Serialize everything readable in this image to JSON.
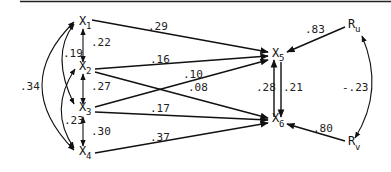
{
  "diagram": {
    "type": "path-diagram",
    "nodes": [
      {
        "id": "X1",
        "base": "X",
        "sub": "1"
      },
      {
        "id": "X2",
        "base": "X",
        "sub": "2"
      },
      {
        "id": "X3",
        "base": "X",
        "sub": "3"
      },
      {
        "id": "X4",
        "base": "X",
        "sub": "4"
      },
      {
        "id": "X5",
        "base": "X",
        "sub": "5"
      },
      {
        "id": "X6",
        "base": "X",
        "sub": "6"
      },
      {
        "id": "Ru",
        "base": "R",
        "sub": "u"
      },
      {
        "id": "Rv",
        "base": "R",
        "sub": "v"
      }
    ],
    "paths": [
      {
        "from": "X1",
        "to": "X5",
        "coef": ".29"
      },
      {
        "from": "X2",
        "to": "X5",
        "coef": ".16"
      },
      {
        "from": "X3",
        "to": "X5",
        "coef": ".10"
      },
      {
        "from": "X2",
        "to": "X6",
        "coef": ".08"
      },
      {
        "from": "X3",
        "to": "X6",
        "coef": ".17"
      },
      {
        "from": "X4",
        "to": "X6",
        "coef": ".37"
      },
      {
        "from": "X5",
        "to": "X6",
        "coef": ".21"
      },
      {
        "from": "X6",
        "to": "X5",
        "coef": ".28"
      },
      {
        "from": "Ru",
        "to": "X5",
        "coef": ".83"
      },
      {
        "from": "Rv",
        "to": "X6",
        "coef": ".80"
      }
    ],
    "correlations": [
      {
        "a": "X1",
        "b": "X2",
        "coef": ".22"
      },
      {
        "a": "X1",
        "b": "X3",
        "coef": ".19"
      },
      {
        "a": "X1",
        "b": "X4",
        "coef": ".34"
      },
      {
        "a": "X2",
        "b": "X3",
        "coef": ".27"
      },
      {
        "a": "X2",
        "b": "X4",
        "coef": ".23"
      },
      {
        "a": "X3",
        "b": "X4",
        "coef": ".30"
      },
      {
        "a": "Ru",
        "b": "Rv",
        "coef": "-.23"
      }
    ]
  }
}
